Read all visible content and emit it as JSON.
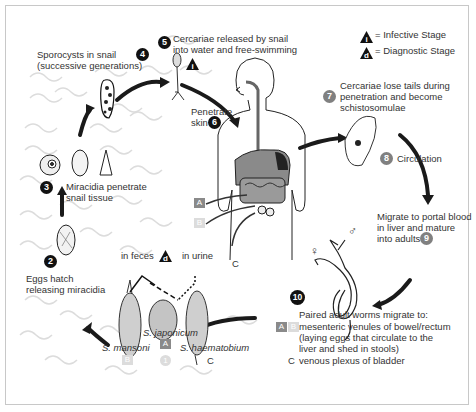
{
  "diagram": {
    "legend": {
      "infective": {
        "symbol": "i",
        "label": "= Infective Stage"
      },
      "diagnostic": {
        "symbol": "d",
        "label": "= Diagnostic Stage"
      }
    },
    "steps": [
      {
        "num": "2",
        "style": "black",
        "lines": [
          "Eggs hatch",
          "releasing miracidia"
        ]
      },
      {
        "num": "3",
        "style": "black",
        "lines": [
          "Miracidia penetrate",
          "snail tissue"
        ]
      },
      {
        "num": "4",
        "style": "black",
        "lines": [
          "Sporocysts in snail",
          "(successive generations)"
        ]
      },
      {
        "num": "5",
        "style": "black",
        "lines": [
          "Cercariae released by snail",
          "into water and free-swimming"
        ]
      },
      {
        "num": "6",
        "style": "black",
        "lines": [
          "Penetrate",
          "skin"
        ]
      },
      {
        "num": "7",
        "style": "gray",
        "lines": [
          "Cercariae lose tails during",
          "penetration and become",
          "schistosomulae"
        ]
      },
      {
        "num": "8",
        "style": "gray",
        "lines": [
          "Circulation"
        ]
      },
      {
        "num": "9",
        "style": "gray",
        "lines": [
          "Migrate to portal blood",
          "in liver and mature",
          "into adults"
        ]
      },
      {
        "num": "10",
        "style": "black",
        "lines": [
          "Paired adult worms migrate to:",
          "mesenteric venules of bowel/rectum",
          "(laying eggs that circulate to the",
          "liver and shed in stools)",
          "venous plexus of bladder"
        ]
      }
    ],
    "step1_num": "1",
    "egg_sources": {
      "feces": "in feces",
      "urine": "in urine"
    },
    "species": [
      {
        "name": "S. mansoni",
        "tag": "B"
      },
      {
        "name": "S. japonicum",
        "tag": "A"
      },
      {
        "name": "S. haematobium",
        "tag": "C"
      }
    ],
    "body_tags": {
      "a": "A",
      "b": "B",
      "c": "C"
    },
    "worm_tags": {
      "a": "A",
      "b": "B",
      "c": "C"
    },
    "sex_symbols": {
      "male": "♂",
      "female": "♀"
    },
    "colors": {
      "arrow": "#1a1a1a",
      "water": "#d9d9d9",
      "gray_num": "#808080",
      "tag_a": "#8a8a8a",
      "tag_b": "#dcdcdc"
    }
  }
}
